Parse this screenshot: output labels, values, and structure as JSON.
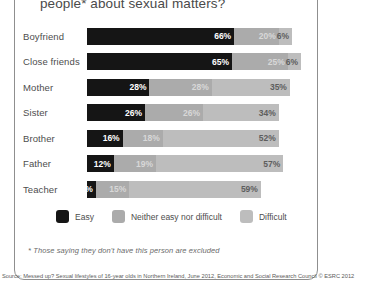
{
  "title": "people* about sexual matters?",
  "footnote": "* Those saying they don't have this person are excluded",
  "source": "Source: Messed up? Sexual lifestyles of 16-year olds in Northern Ireland, June 2012, Economic and Social Research Council © ESRC 2012",
  "colors": {
    "easy": "#151515",
    "neither": "#ababab",
    "difficult": "#bdbdbd"
  },
  "legend": [
    {
      "label": "Easy",
      "color": "#151515"
    },
    {
      "label": "Neither easy nor difficult",
      "color": "#ababab"
    },
    {
      "label": "Difficult",
      "color": "#bdbdbd"
    }
  ],
  "chart_data": {
    "type": "bar",
    "title": "people* about sexual matters?",
    "xlabel": "",
    "ylabel": "",
    "xlim": [
      0,
      100
    ],
    "grid": false,
    "stacked": true,
    "orientation": "horizontal",
    "legend_position": "bottom",
    "categories": [
      "Boyfriend",
      "Close friends",
      "Mother",
      "Sister",
      "Brother",
      "Father",
      "Teacher"
    ],
    "series": [
      {
        "name": "Easy",
        "values": [
          66,
          65,
          28,
          26,
          16,
          12,
          4
        ]
      },
      {
        "name": "Neither easy nor difficult",
        "values": [
          20,
          25,
          28,
          26,
          18,
          19,
          15
        ]
      },
      {
        "name": "Difficult",
        "values": [
          6,
          6,
          35,
          34,
          52,
          57,
          59
        ]
      }
    ],
    "labels": [
      {
        "category": "Boyfriend",
        "easy": "66%",
        "neither": "20%",
        "difficult": "6%"
      },
      {
        "category": "Close friends",
        "easy": "65%",
        "neither": "25%",
        "difficult": "6%"
      },
      {
        "category": "Mother",
        "easy": "28%",
        "neither": "28%",
        "difficult": "35%"
      },
      {
        "category": "Sister",
        "easy": "26%",
        "neither": "26%",
        "difficult": "34%"
      },
      {
        "category": "Brother",
        "easy": "16%",
        "neither": "18%",
        "difficult": "52%"
      },
      {
        "category": "Father",
        "easy": "12%",
        "neither": "19%",
        "difficult": "57%"
      },
      {
        "category": "Teacher",
        "easy": "4%",
        "neither": "15%",
        "difficult": "59%"
      }
    ]
  }
}
